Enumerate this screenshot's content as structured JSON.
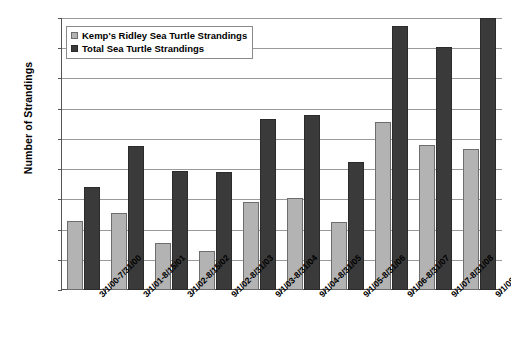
{
  "chart_data": {
    "type": "bar",
    "title": "",
    "xlabel": "",
    "ylabel": "Number of Strandings",
    "ylim": [
      0,
      180
    ],
    "ytick_step": 20,
    "yticks": [
      0,
      20,
      40,
      60,
      80,
      100,
      120,
      140,
      160,
      180
    ],
    "grid": true,
    "legend_position": "top-left",
    "categories": [
      "3/1/00-7/31/00",
      "3/1/01-8/15/01",
      "3/1/02-8/15/02",
      "9/1/02-8/31/03",
      "9/1/03-8/31/04",
      "9/1/04-8/31/05",
      "9/1/05-8/31/06",
      "9/1/06-8/31/07",
      "9/1/07-8/31/08",
      "9/1/08-8/31/09"
    ],
    "series": [
      {
        "name": "Kemp's Ridley Sea Turtle Strandings",
        "color": "#b3b3b3",
        "values": [
          46,
          51,
          31,
          26,
          58,
          61,
          45,
          111,
          96,
          93
        ]
      },
      {
        "name": "Total Sea Turtle Strandings",
        "color": "#3a3a3a",
        "values": [
          68,
          95,
          79,
          78,
          113,
          116,
          85,
          175,
          161,
          180
        ]
      }
    ]
  },
  "legend": {
    "items": [
      {
        "label": "Kemp's Ridley Sea Turtle Strandings"
      },
      {
        "label": "Total Sea Turtle Strandings"
      }
    ]
  }
}
